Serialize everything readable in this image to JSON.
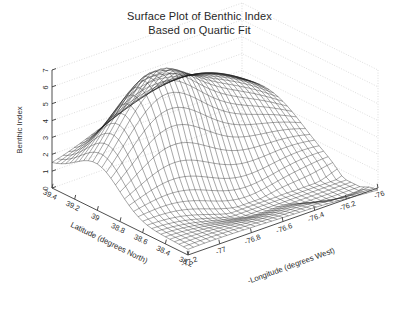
{
  "figure": {
    "title_line1": "Surface Plot of Benthic Index",
    "title_line2": "Based on Quartic Fit",
    "background_color": "#ffffff",
    "mesh_color": "#1c1c1c",
    "axis_color": "#3a3a3a",
    "grid_color": "#cfcfcf"
  },
  "chart_data": {
    "type": "surface",
    "title": "Surface Plot of Benthic Index\nBased on Quartic Fit",
    "xlabel": "-Longitude (degrees West)",
    "ylabel": "Latitude (degrees North)",
    "zlabel": "Benthic Index",
    "grid": true,
    "legend": null,
    "projection": "3d-wireframe",
    "x_ticks": [
      "-77.2",
      "-77",
      "-76.8",
      "-76.6",
      "-76.4",
      "-76.2",
      "-76"
    ],
    "x_tick_values": [
      -77.2,
      -77.0,
      -76.8,
      -76.6,
      -76.4,
      -76.2,
      -76.0
    ],
    "y_ticks": [
      "39.4",
      "39.2",
      "39",
      "38.8",
      "38.6",
      "38.4",
      "38.2"
    ],
    "y_tick_values": [
      39.4,
      39.2,
      39.0,
      38.8,
      38.6,
      38.4,
      38.2
    ],
    "z_ticks": [
      "0",
      "1",
      "2",
      "3",
      "4",
      "5",
      "6",
      "7"
    ],
    "z_tick_values": [
      0,
      1,
      2,
      3,
      4,
      5,
      6,
      7
    ],
    "xlim": [
      -77.3,
      -75.9
    ],
    "ylim": [
      38.1,
      39.5
    ],
    "zlim": [
      0,
      7
    ],
    "surface_model": "quartic polynomial fit of benthic index on longitude and latitude",
    "mesh_nx": 34,
    "mesh_ny": 30,
    "features": [
      "broad ridge peaking near z=5 over the north-west quadrant",
      "saddle valley running diagonally across the centre",
      "dense dark convergence of mesh lines funnelling to a narrow spike near -76.2 longitude, 38.3 latitude",
      "surface skirt descending below z=1 along the south-west margin"
    ]
  },
  "axes": {
    "z_label": "Benthic Index",
    "y_label": "Latitude (degrees North)",
    "x_label": "-Longitude (degrees West)"
  }
}
